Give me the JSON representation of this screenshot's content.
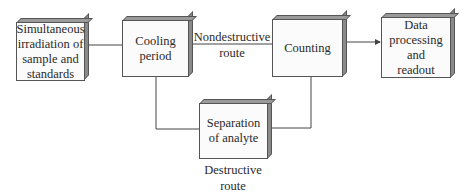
{
  "diagram": {
    "nodes": [
      {
        "id": "irradiation",
        "label": "Simultaneous irradiation of sample and standards",
        "lines": [
          "Simultaneous",
          "irradiation of",
          "sample and",
          "standards"
        ]
      },
      {
        "id": "cooling",
        "label": "Cooling period",
        "lines": [
          "Cooling",
          "period"
        ]
      },
      {
        "id": "counting",
        "label": "Counting",
        "lines": [
          "Counting"
        ]
      },
      {
        "id": "data",
        "label": "Data processing and readout",
        "lines": [
          "Data",
          "processing",
          "and",
          "readout"
        ]
      },
      {
        "id": "separation",
        "label": "Separation of analyte",
        "lines": [
          "Separation",
          "of analyte"
        ]
      }
    ],
    "edges": [
      {
        "from": "irradiation",
        "to": "cooling",
        "label": ""
      },
      {
        "from": "cooling",
        "to": "counting",
        "label": "Nondestructive route"
      },
      {
        "from": "cooling",
        "to": "separation",
        "label": "Destructive route"
      },
      {
        "from": "separation",
        "to": "counting",
        "label": ""
      },
      {
        "from": "counting",
        "to": "data",
        "label": "",
        "arrow": true
      }
    ],
    "route_labels": {
      "nondestructive": [
        "Nondestructive",
        "route"
      ],
      "destructive": [
        "Destructive",
        "route"
      ]
    }
  },
  "colors": {
    "line": "#444444",
    "box_face": "#fbfbfb",
    "box_top": "#9a9a9a",
    "box_side": "#8a8a8a"
  }
}
